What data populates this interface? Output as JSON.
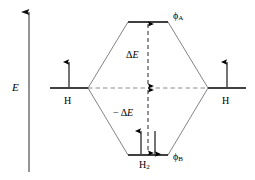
{
  "diagram": {
    "kind": "molecular-orbital-energy-level-diagram",
    "axis": {
      "label": "E",
      "direction": "up",
      "meaning": "energy-increasing-upward"
    },
    "fragments": {
      "left": {
        "atom_label": "H",
        "electrons": [
          "up"
        ]
      },
      "right": {
        "atom_label": "H",
        "electrons": [
          "up"
        ]
      }
    },
    "molecular_orbitals": {
      "antibonding": {
        "label_phi": "ϕ",
        "label_sub": "A",
        "electrons": []
      },
      "bonding": {
        "label_phi": "ϕ",
        "label_sub": "B",
        "electrons": [
          "up",
          "down"
        ]
      }
    },
    "molecule": {
      "label_main": "H",
      "label_sub": "2"
    },
    "energy_gaps": {
      "upper": {
        "delta": "Δ",
        "symbol": "E",
        "sign": ""
      },
      "lower": {
        "delta": "Δ",
        "symbol": "E",
        "sign": "− "
      }
    },
    "colors": {
      "ink": "#000000",
      "correlation_line": "#555555",
      "dashed_line": "#777777",
      "background": "#ffffff"
    }
  }
}
